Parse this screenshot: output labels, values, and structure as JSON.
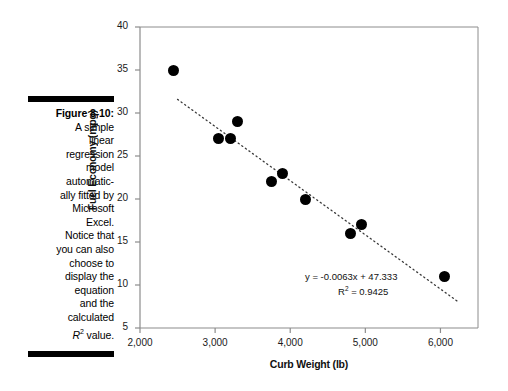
{
  "figure": {
    "label": "Figure 8-10:",
    "caption_lines": [
      "A simple",
      "linear",
      "regression",
      "model",
      "automatic-",
      "ally fitted by",
      "Microsoft",
      "Excel.",
      "Notice that",
      "you can also",
      "choose to",
      "display the",
      "equation",
      "and the",
      "calculated"
    ],
    "caption_last_prefix": "R",
    "caption_last_sup": "2",
    "caption_last_suffix": " value."
  },
  "chart_data": {
    "type": "scatter",
    "title": "",
    "xlabel": "Curb Weight (lb)",
    "ylabel": "Fuel Economy (mpg)",
    "xlim": [
      2000,
      6500
    ],
    "ylim": [
      5,
      40
    ],
    "xticks": [
      2000,
      3000,
      4000,
      5000,
      6000
    ],
    "xtick_labels": [
      "2,000",
      "3,000",
      "4,000",
      "5,000",
      "6,000"
    ],
    "yticks": [
      5,
      10,
      15,
      20,
      25,
      30,
      35,
      40
    ],
    "ytick_labels": [
      "5",
      "10",
      "15",
      "20",
      "25",
      "30",
      "35",
      "40"
    ],
    "grid": false,
    "legend": null,
    "marker_color": "#000000",
    "points": [
      {
        "x": 2450,
        "y": 35
      },
      {
        "x": 3050,
        "y": 27
      },
      {
        "x": 3200,
        "y": 27
      },
      {
        "x": 3300,
        "y": 29
      },
      {
        "x": 3750,
        "y": 22
      },
      {
        "x": 3900,
        "y": 23
      },
      {
        "x": 4200,
        "y": 20
      },
      {
        "x": 4800,
        "y": 16
      },
      {
        "x": 4950,
        "y": 17
      },
      {
        "x": 6050,
        "y": 11
      }
    ],
    "trendline": {
      "style": "dotted",
      "slope": -0.0063,
      "intercept": 47.333,
      "x_start": 2500,
      "x_end": 6250,
      "equation_text": "y = -0.0063x + 47.333",
      "r2_prefix": "R",
      "r2_sup": "2",
      "r2_value": " = 0.9425"
    }
  }
}
